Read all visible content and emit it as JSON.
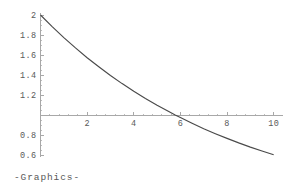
{
  "output_label": "-Graphics-",
  "colors": {
    "background": "#ffffff",
    "axis": "#a8a8a8",
    "curve": "#4a4a4a",
    "text": "#5a5a5a"
  },
  "chart_data": {
    "type": "line",
    "title": "",
    "xlabel": "",
    "ylabel": "",
    "xlim": [
      0,
      10.4
    ],
    "ylim": [
      0.58,
      2.02
    ],
    "grid": false,
    "legend": null,
    "axis_origin_y": 1,
    "x_ticks": [
      2,
      4,
      6,
      8,
      10
    ],
    "x_tick_labels": [
      "2",
      "4",
      "6",
      "8",
      "10"
    ],
    "x_minor_tick_step": 0.4,
    "y_ticks": [
      0.6,
      0.8,
      1.2,
      1.4,
      1.6,
      1.8,
      2
    ],
    "y_tick_labels": [
      "0.6",
      "0.8",
      "1.2",
      "1.4",
      "1.6",
      "1.8",
      "2"
    ],
    "y_minor_tick_step": 0.05,
    "function": "2 * e^(-0.12 * x)",
    "series": [
      {
        "name": "2 E^(-0.12 x)",
        "x": [
          0,
          0.5,
          1,
          1.5,
          2,
          2.5,
          3,
          3.5,
          4,
          4.5,
          5,
          5.5,
          5.776,
          6,
          6.5,
          7,
          7.5,
          8,
          8.5,
          9,
          9.5,
          10
        ],
        "values": [
          2.0,
          1.884,
          1.774,
          1.671,
          1.573,
          1.482,
          1.395,
          1.314,
          1.238,
          1.166,
          1.098,
          1.034,
          1.0,
          0.974,
          0.917,
          0.863,
          0.813,
          0.766,
          0.721,
          0.679,
          0.64,
          0.602
        ]
      }
    ]
  }
}
